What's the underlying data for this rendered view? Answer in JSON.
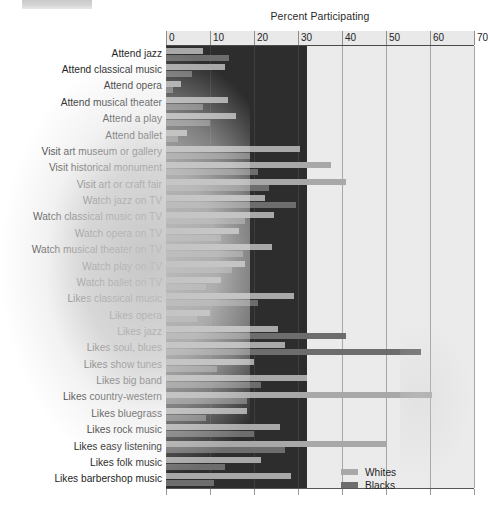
{
  "chart_data": {
    "type": "bar",
    "orientation": "horizontal",
    "title": "Percent Participating",
    "xlabel": "",
    "ylabel": "",
    "xlim": [
      0,
      70
    ],
    "xticks": [
      0,
      10,
      20,
      30,
      40,
      50,
      60,
      70
    ],
    "grid": true,
    "legend_position": "bottom-right",
    "legend": [
      "Whites",
      "Blacks"
    ],
    "colors": {
      "whites": "#a8a8a8",
      "blacks": "#6d6d6d",
      "panel_dark": "#2d2d2d",
      "panel_light": "#ebebeb"
    },
    "categories": [
      "Attend jazz",
      "Attend classical music",
      "Attend opera",
      "Attend musical theater",
      "Attend a play",
      "Attend ballet",
      "Visit art museum or gallery",
      "Visit historical monument",
      "Visit art or craft fair",
      "Watch jazz on TV",
      "Watch classical music on TV",
      "Watch opera on TV",
      "Watch musical theater on TV",
      "Watch play on TV",
      "Watch ballet on TV",
      "Likes classical music",
      "Likes opera",
      "Likes jazz",
      "Likes soul, blues",
      "Likes show tunes",
      "Likes big band",
      "Likes country-western",
      "Likes bluegrass",
      "Likes rock music",
      "Likes easy listening",
      "Likes folk music",
      "Likes barbershop music"
    ],
    "series": [
      {
        "name": "Whites",
        "color": "#a8a8a8",
        "values": [
          8.4,
          13.5,
          3.3,
          14.0,
          16.0,
          4.8,
          30.5,
          37.5,
          41.0,
          22.5,
          24.5,
          16.5,
          24.0,
          18.0,
          12.5,
          29.0,
          10.0,
          25.5,
          27.0,
          20.0,
          32.0,
          60.5,
          18.5,
          26.0,
          50.0,
          21.5,
          28.5
        ],
        "unit": "percent"
      },
      {
        "name": "Blacks",
        "color": "#6d6d6d",
        "values": [
          14.3,
          6.0,
          1.5,
          8.5,
          10.0,
          2.8,
          19.0,
          21.0,
          23.5,
          29.5,
          18.0,
          12.5,
          17.5,
          15.0,
          9.0,
          21.0,
          7.0,
          41.0,
          58.0,
          11.5,
          21.5,
          18.5,
          9.0,
          20.0,
          27.0,
          13.5,
          11.0
        ],
        "unit": "percent"
      }
    ]
  }
}
